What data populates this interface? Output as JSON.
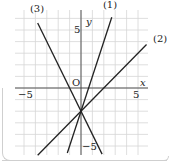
{
  "chart_data": {
    "type": "line",
    "title": "",
    "xlabel": "x",
    "ylabel": "y",
    "origin_label": "O",
    "xlim": [
      -6,
      6
    ],
    "ylim": [
      -7,
      7
    ],
    "x_ticks_labeled": [
      -5,
      5
    ],
    "y_ticks_labeled": [
      5,
      -5
    ],
    "grid": true,
    "series": [
      {
        "name": "(1)",
        "equation": "y = 3x - 2",
        "slope": 3,
        "intercept": -2
      },
      {
        "name": "(2)",
        "equation": "y = x - 2",
        "slope": 1,
        "intercept": -2
      },
      {
        "name": "(3)",
        "equation": "y = -2x - 2",
        "slope": -2,
        "intercept": -2
      }
    ],
    "intersection": [
      0,
      -2
    ]
  },
  "labels": {
    "x_axis": "x",
    "y_axis": "y",
    "origin": "O",
    "x_neg5": "−5",
    "x_pos5": "5",
    "y_pos5": "5",
    "y_neg5": "−5",
    "line1": "(1)",
    "line2": "(2)",
    "line3": "(3)"
  },
  "colors": {
    "line": "#222222",
    "grid": "#d6d6d6",
    "axis": "#444444",
    "panel_border": "#cfcfcf"
  }
}
